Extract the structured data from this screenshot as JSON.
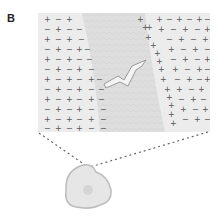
{
  "figure": {
    "panel_label": "B",
    "charges": {
      "outside_symbols": [
        "+",
        "-"
      ],
      "membrane_left_symbols": [
        "-"
      ],
      "membrane_right_symbols": [
        "+"
      ]
    },
    "colors": {
      "background": "#ffffff",
      "panel_fill": "#e9e9e9",
      "membrane_fill": "#dcdcdc",
      "symbol": "#555555",
      "dashed_line": "#666666",
      "cell_fill": "#e4e4e4",
      "cell_outline": "#bdbdbd"
    }
  }
}
